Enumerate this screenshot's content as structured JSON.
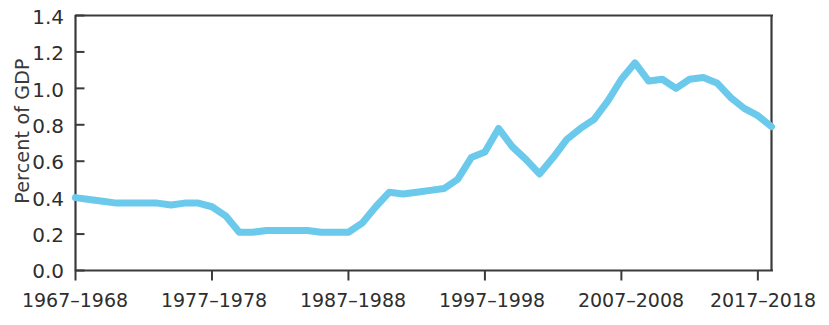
{
  "chart_data": {
    "type": "line",
    "title": "",
    "xlabel": "",
    "ylabel": "Percent of GDP",
    "ylim": [
      0.0,
      1.4
    ],
    "yticks": [
      0.0,
      0.2,
      0.4,
      0.6,
      0.8,
      1.0,
      1.2,
      1.4
    ],
    "ytick_labels": [
      "0.0",
      "0.2",
      "0.4",
      "0.6",
      "0.8",
      "1.0",
      "1.2",
      "1.4"
    ],
    "xtick_labels": [
      "1967–1968",
      "1977–1978",
      "1987–1988",
      "1997–1998",
      "2007–2008",
      "2017–2018"
    ],
    "xtick_values": [
      1967,
      1977,
      1987,
      1997,
      2007,
      2017
    ],
    "xlim": [
      1967,
      2018
    ],
    "grid": false,
    "legend": null,
    "line_color": "#6BC9EC",
    "line_width": 7,
    "series": [
      {
        "name": "Percent of GDP",
        "x": [
          1967,
          1968,
          1969,
          1970,
          1971,
          1972,
          1973,
          1974,
          1975,
          1976,
          1977,
          1978,
          1979,
          1980,
          1981,
          1982,
          1983,
          1984,
          1985,
          1986,
          1987,
          1988,
          1989,
          1990,
          1991,
          1992,
          1993,
          1994,
          1995,
          1996,
          1997,
          1998,
          1999,
          2000,
          2001,
          2002,
          2003,
          2004,
          2005,
          2006,
          2007,
          2008,
          2009,
          2010,
          2011,
          2012,
          2013,
          2014,
          2015,
          2016,
          2017,
          2018
        ],
        "values": [
          0.4,
          0.39,
          0.38,
          0.37,
          0.37,
          0.37,
          0.37,
          0.36,
          0.37,
          0.37,
          0.35,
          0.3,
          0.21,
          0.21,
          0.22,
          0.22,
          0.22,
          0.22,
          0.21,
          0.21,
          0.21,
          0.26,
          0.35,
          0.43,
          0.42,
          0.43,
          0.44,
          0.45,
          0.5,
          0.62,
          0.65,
          0.78,
          0.68,
          0.61,
          0.53,
          0.62,
          0.72,
          0.78,
          0.83,
          0.93,
          1.05,
          1.14,
          1.04,
          1.05,
          1.0,
          1.05,
          1.06,
          1.03,
          0.95,
          0.89,
          0.85,
          0.79
        ]
      }
    ]
  },
  "axis": {
    "ylabel": "Percent of GDP"
  }
}
